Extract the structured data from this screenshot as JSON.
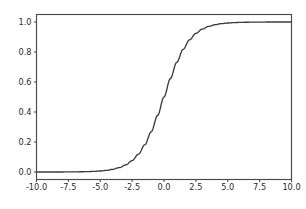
{
  "figure": {
    "background_color": "#ffffff",
    "axes_background_color": "#ffffff",
    "spine_color": "#4a4a4a",
    "tick_label_color": "#2b2b2b"
  },
  "chart_data": {
    "type": "line",
    "title": "",
    "xlabel": "",
    "ylabel": "",
    "xlim": [
      -10.0,
      10.0
    ],
    "ylim": [
      -0.05,
      1.05
    ],
    "grid": false,
    "legend": null,
    "legend_position": "none",
    "xticks": [
      -10.0,
      -7.5,
      -5.0,
      -2.5,
      0.0,
      2.5,
      5.0,
      7.5,
      10.0
    ],
    "xtick_labels": [
      "-10.0",
      "-7.5",
      "-5.0",
      "-2.5",
      "0.0",
      "2.5",
      "5.0",
      "7.5",
      "10.0"
    ],
    "yticks": [
      0.0,
      0.2,
      0.4,
      0.6,
      0.8,
      1.0
    ],
    "ytick_labels": [
      "0.0",
      "0.2",
      "0.4",
      "0.6",
      "0.8",
      "1.0"
    ],
    "series": [
      {
        "name": "sigmoid",
        "color": "#3b3b3b",
        "line_width": 1.35,
        "x": [
          -10.0,
          -9.5,
          -9.0,
          -8.5,
          -8.0,
          -7.5,
          -7.0,
          -6.5,
          -6.0,
          -5.5,
          -5.0,
          -4.5,
          -4.0,
          -3.5,
          -3.0,
          -2.5,
          -2.0,
          -1.5,
          -1.0,
          -0.5,
          0.0,
          0.5,
          1.0,
          1.5,
          2.0,
          2.5,
          3.0,
          3.5,
          4.0,
          4.5,
          5.0,
          5.5,
          6.0,
          6.5,
          7.0,
          7.5,
          8.0,
          8.5,
          9.0,
          9.5,
          10.0
        ],
        "y": [
          0.0,
          0.0001,
          0.0001,
          0.0002,
          0.0003,
          0.0006,
          0.0009,
          0.0015,
          0.0025,
          0.0041,
          0.0067,
          0.011,
          0.018,
          0.0293,
          0.0474,
          0.0759,
          0.1192,
          0.1824,
          0.2689,
          0.3775,
          0.5,
          0.6225,
          0.7311,
          0.8176,
          0.8808,
          0.9241,
          0.9526,
          0.9707,
          0.982,
          0.989,
          0.9933,
          0.9959,
          0.9975,
          0.9985,
          0.9991,
          0.9994,
          0.9997,
          0.9998,
          0.9999,
          0.9999,
          1.0
        ]
      }
    ]
  }
}
